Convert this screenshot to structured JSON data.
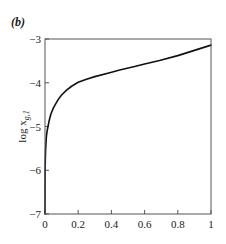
{
  "panel_label": "(b)",
  "chart_data": {
    "type": "line",
    "title": "",
    "xlabel": "",
    "ylabel": "log x_{g,1}",
    "ylabel_main": "log x",
    "ylabel_sub": "g,1",
    "xlim": [
      0,
      1
    ],
    "ylim": [
      -7,
      -3
    ],
    "xticks": [
      0,
      0.2,
      0.4,
      0.6,
      0.8,
      1
    ],
    "xtick_labels": [
      "0",
      "0.2",
      "0.4",
      "0.6",
      "0.8",
      "1"
    ],
    "yticks": [
      -3,
      -4,
      -5,
      -6,
      -7
    ],
    "ytick_labels": [
      "−3",
      "−4",
      "−5",
      "−6",
      "−7"
    ],
    "grid": false,
    "legend": null,
    "series": [
      {
        "name": "log x_{g,1}",
        "color": "#111111",
        "x": [
          0,
          0.0005,
          0.001,
          0.002,
          0.004,
          0.008,
          0.012,
          0.018,
          0.025,
          0.035,
          0.05,
          0.066,
          0.08,
          0.1,
          0.13,
          0.16,
          0.2,
          0.25,
          0.3,
          0.39,
          0.45,
          0.54,
          0.6,
          0.69,
          0.8,
          0.9,
          1.0
        ],
        "y": [
          -7.0,
          -6.3,
          -6.0,
          -5.75,
          -5.5,
          -5.25,
          -5.12,
          -5.0,
          -4.87,
          -4.72,
          -4.58,
          -4.47,
          -4.38,
          -4.28,
          -4.17,
          -4.08,
          -3.99,
          -3.92,
          -3.86,
          -3.77,
          -3.71,
          -3.63,
          -3.57,
          -3.49,
          -3.38,
          -3.26,
          -3.14
        ]
      }
    ]
  }
}
